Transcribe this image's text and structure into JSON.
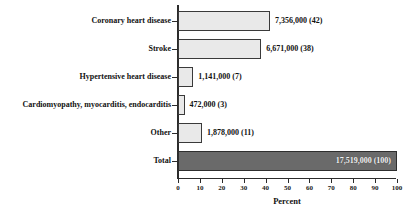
{
  "chart_data": {
    "type": "bar",
    "orientation": "horizontal",
    "title": "",
    "xlabel": "Percent",
    "ylabel": "",
    "xlim": [
      0,
      100
    ],
    "xticks": [
      0,
      10,
      20,
      30,
      40,
      50,
      60,
      70,
      80,
      90,
      100
    ],
    "xtick_labels": [
      "0",
      "10",
      "20",
      "30",
      "40",
      "50",
      "60",
      "70",
      "80",
      "90",
      "100"
    ],
    "grid": false,
    "legend": null,
    "categories": [
      "Coronary heart disease",
      "Stroke",
      "Hypertensive heart disease",
      "Cardiomyopathy, myocarditis, endocarditis",
      "Other",
      "Total"
    ],
    "values": [
      42,
      38,
      7,
      3,
      11,
      100
    ],
    "data_labels": [
      "7,356,000 (42)",
      "6,671,000 (38)",
      "1,141,000 (7)",
      "472,000 (3)",
      "1,878,000 (11)",
      "17,519,000 (100)"
    ],
    "counts": [
      7356000,
      6671000,
      1141000,
      472000,
      1878000,
      17519000
    ],
    "bars": [
      {
        "category": "Coronary heart disease",
        "value": 42,
        "count": "7,356,000",
        "percent": "(42)",
        "label": "7,356,000 (42)",
        "style": "light",
        "label_position": "outside"
      },
      {
        "category": "Stroke",
        "value": 38,
        "count": "6,671,000",
        "percent": "(38)",
        "label": "6,671,000 (38)",
        "style": "light",
        "label_position": "outside"
      },
      {
        "category": "Hypertensive heart disease",
        "value": 7,
        "count": "1,141,000",
        "percent": "(7)",
        "label": "1,141,000 (7)",
        "style": "light",
        "label_position": "outside"
      },
      {
        "category": "Cardiomyopathy, myocarditis, endocarditis",
        "value": 3,
        "count": "472,000",
        "percent": "(3)",
        "label": "472,000 (3)",
        "style": "light",
        "label_position": "outside"
      },
      {
        "category": "Other",
        "value": 11,
        "count": "1,878,000",
        "percent": "(11)",
        "label": "1,878,000 (11)",
        "style": "light",
        "label_position": "outside"
      },
      {
        "category": "Total",
        "value": 100,
        "count": "17,519,000",
        "percent": "(100)",
        "label": "17,519,000 (100)",
        "style": "dark",
        "label_position": "inside"
      }
    ],
    "colors": {
      "bar_light_fill": "#e9e9e9",
      "bar_dark_fill": "#6a6a6a",
      "bar_stroke": "#3a3a3a",
      "axis": "#2b2b2b",
      "text": "#111111",
      "background": "#ffffff",
      "inside_label_text": "#f2f2f2"
    }
  }
}
